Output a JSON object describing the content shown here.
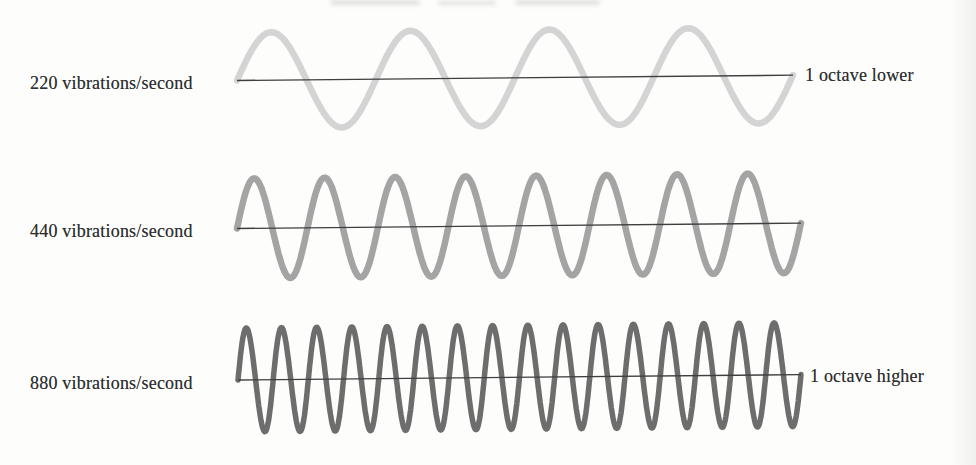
{
  "figure": {
    "description_colors": {
      "background": "#fdfdfc",
      "axis_color": "#3f3f3f",
      "text_color": "#2e2e2e"
    },
    "rows": [
      {
        "frequency_label": "220 vibrations/second",
        "frequency_hz": 220,
        "right_label": "1 octave lower",
        "cycles": 4,
        "amplitude": 48,
        "stroke_width": 6.5,
        "wave_color": "#d4d4d4"
      },
      {
        "frequency_label": "440 vibrations/second",
        "frequency_hz": 440,
        "right_label": "",
        "cycles": 8,
        "amplitude": 50,
        "stroke_width": 6.5,
        "wave_color": "#a4a4a4"
      },
      {
        "frequency_label": "880 vibrations/second",
        "frequency_hz": 880,
        "right_label": "1 octave higher",
        "cycles": 16,
        "amplitude": 52,
        "stroke_width": 5.5,
        "wave_color": "#6d6d6d"
      }
    ]
  }
}
